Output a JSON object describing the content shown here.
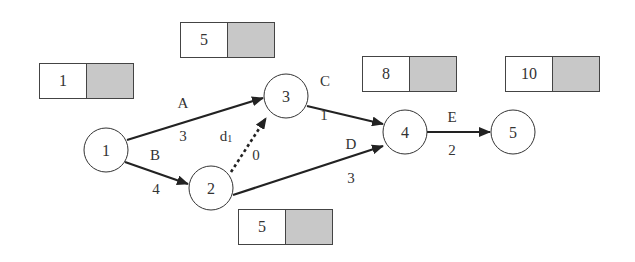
{
  "diagram": {
    "type": "activity-on-arrow network",
    "nodes": [
      {
        "id": "1",
        "label": "1",
        "cx": 106,
        "cy": 150
      },
      {
        "id": "2",
        "label": "2",
        "cx": 211,
        "cy": 188
      },
      {
        "id": "3",
        "label": "3",
        "cx": 286,
        "cy": 96
      },
      {
        "id": "4",
        "label": "4",
        "cx": 405,
        "cy": 132
      },
      {
        "id": "5",
        "label": "5",
        "cx": 513,
        "cy": 132
      }
    ],
    "edges": [
      {
        "from": "1",
        "to": "3",
        "activity": "A",
        "duration": "3",
        "dummy": false
      },
      {
        "from": "1",
        "to": "2",
        "activity": "B",
        "duration": "4",
        "dummy": false
      },
      {
        "from": "2",
        "to": "3",
        "activity": "d",
        "activity_sub": "1",
        "duration": "0",
        "dummy": true
      },
      {
        "from": "3",
        "to": "4",
        "activity": "C",
        "duration": "1",
        "dummy": false
      },
      {
        "from": "2",
        "to": "4",
        "activity": "D",
        "duration": "3",
        "dummy": false
      },
      {
        "from": "4",
        "to": "5",
        "activity": "E",
        "duration": "2",
        "dummy": false
      }
    ],
    "time_boxes": [
      {
        "node": "1",
        "earliest": "1",
        "latest": ""
      },
      {
        "node": "3",
        "earliest": "5",
        "latest": ""
      },
      {
        "node": "2",
        "earliest": "5",
        "latest": ""
      },
      {
        "node": "4",
        "earliest": "8",
        "latest": ""
      },
      {
        "node": "5",
        "earliest": "10",
        "latest": ""
      }
    ],
    "shade_color": "#c8c8c8"
  }
}
